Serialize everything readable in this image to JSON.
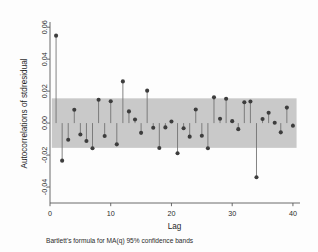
{
  "chart_data": {
    "type": "scatter",
    "title": "",
    "subtitle": "",
    "xlabel": "Lag",
    "ylabel": "Autocorrelations of stdresidual",
    "caption": "Bartlett's formula for MA(q) 95% confidence bands",
    "xlim": [
      0,
      41
    ],
    "ylim": [
      -0.05,
      0.062
    ],
    "xticks": [
      0,
      10,
      20,
      30,
      40
    ],
    "xticklabels": [
      "0",
      "10",
      "20",
      "30",
      "40"
    ],
    "yticks": [
      -0.04,
      -0.02,
      0.0,
      0.02,
      0.04,
      0.06
    ],
    "yticklabels": [
      "-0.04",
      "-0.02",
      "0.00",
      "0.02",
      "0.04",
      "0.06"
    ],
    "grid": false,
    "legend_position": "none",
    "confidence_band": {
      "label": "95% confidence band",
      "upper": 0.0155,
      "lower": -0.0155,
      "color": "#c9c9c9",
      "x_start": 0.3,
      "x_end": 40.6
    },
    "marker_color": "#3d3d3d",
    "stem_color": "#6e6e6e",
    "x": [
      1,
      2,
      3,
      4,
      5,
      6,
      7,
      8,
      9,
      10,
      11,
      12,
      13,
      14,
      15,
      16,
      17,
      18,
      19,
      20,
      21,
      22,
      23,
      24,
      25,
      26,
      27,
      28,
      29,
      30,
      31,
      32,
      33,
      34,
      35,
      36,
      37,
      38,
      39,
      40
    ],
    "values": [
      0.0547,
      -0.0235,
      -0.0104,
      0.0083,
      -0.0071,
      -0.0112,
      -0.0157,
      0.0146,
      -0.0081,
      0.0137,
      -0.0133,
      0.0261,
      0.0073,
      0.0022,
      -0.0061,
      0.0203,
      -0.0029,
      -0.0156,
      -0.0027,
      0.001,
      -0.0189,
      -0.0032,
      -0.0085,
      0.0085,
      -0.0079,
      -0.0157,
      0.0161,
      0.0027,
      0.0152,
      0.0012,
      -0.0038,
      0.013,
      0.0135,
      -0.0339,
      0.0026,
      0.0065,
      0.0002,
      -0.0058,
      0.0097,
      -0.0017
    ]
  }
}
